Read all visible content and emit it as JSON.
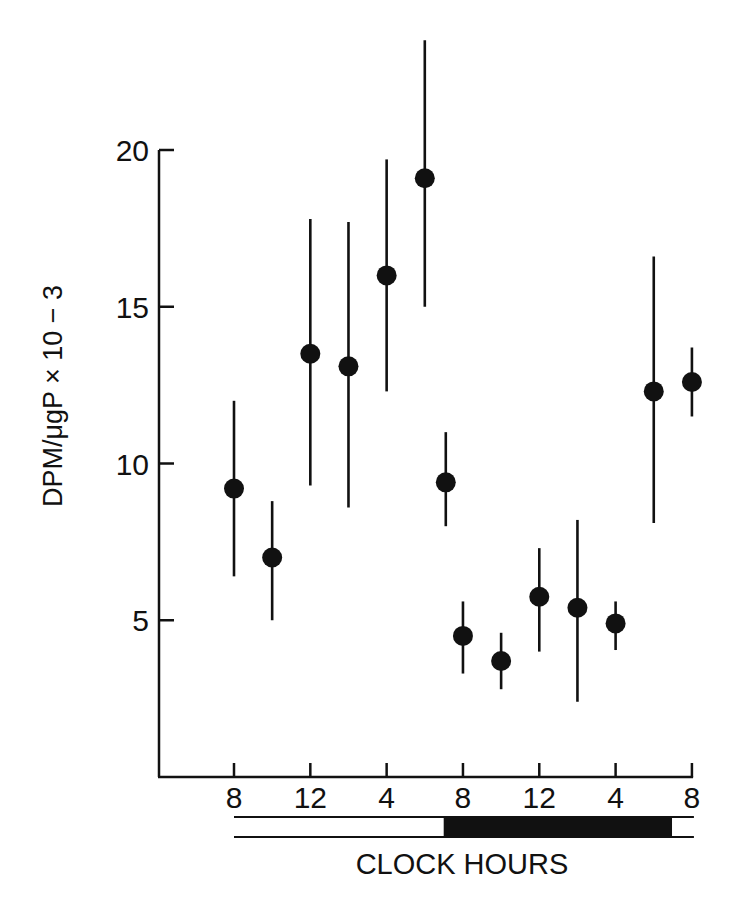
{
  "chart_data": {
    "type": "scatter",
    "title": "",
    "xlabel": "CLOCK HOURS",
    "ylabel": "DPM/μgP × 10 − 3",
    "ylim": [
      0,
      20
    ],
    "yticks": [
      5,
      10,
      15,
      20
    ],
    "ytick_labels": [
      "5",
      "10",
      "15",
      "20"
    ],
    "xticks_hours": [
      8,
      12,
      16,
      20,
      24,
      28,
      32
    ],
    "xtick_labels": [
      "8",
      "12",
      "4",
      "8",
      "12",
      "4",
      "8"
    ],
    "xlim_hours": [
      4.1,
      32
    ],
    "grid": false,
    "legend": null,
    "marker": "filled-circle",
    "error_bars": true,
    "light_dark_bar": {
      "light_start_hour": 8,
      "dark_start_hour": 19.2,
      "dark_end_hour": 31.9,
      "end_hour": 32
    },
    "series": [
      {
        "name": "DPM/μgP",
        "points": [
          {
            "x": 8,
            "y": 9.2,
            "y_low": 6.4,
            "y_high": 12.0
          },
          {
            "x": 10,
            "y": 7.0,
            "y_low": 5.0,
            "y_high": 8.8
          },
          {
            "x": 12,
            "y": 13.5,
            "y_low": 9.3,
            "y_high": 17.8
          },
          {
            "x": 14,
            "y": 13.1,
            "y_low": 8.6,
            "y_high": 17.7
          },
          {
            "x": 16,
            "y": 16.0,
            "y_low": 12.3,
            "y_high": 19.7
          },
          {
            "x": 18,
            "y": 19.1,
            "y_low": 15.0,
            "y_high": 23.5
          },
          {
            "x": 19.1,
            "y": 9.4,
            "y_low": 8.0,
            "y_high": 11.0
          },
          {
            "x": 20,
            "y": 4.5,
            "y_low": 3.3,
            "y_high": 5.6
          },
          {
            "x": 22,
            "y": 3.7,
            "y_low": 2.8,
            "y_high": 4.6
          },
          {
            "x": 24,
            "y": 5.75,
            "y_low": 4.0,
            "y_high": 7.3
          },
          {
            "x": 26,
            "y": 5.4,
            "y_low": 2.4,
            "y_high": 8.2
          },
          {
            "x": 28,
            "y": 4.9,
            "y_low": 4.05,
            "y_high": 5.6
          },
          {
            "x": 30,
            "y": 12.3,
            "y_low": 8.1,
            "y_high": 16.6
          },
          {
            "x": 32,
            "y": 12.6,
            "y_low": 11.5,
            "y_high": 13.7
          }
        ]
      }
    ]
  },
  "layout": {
    "ink": "#111111",
    "background": "#ffffff"
  }
}
